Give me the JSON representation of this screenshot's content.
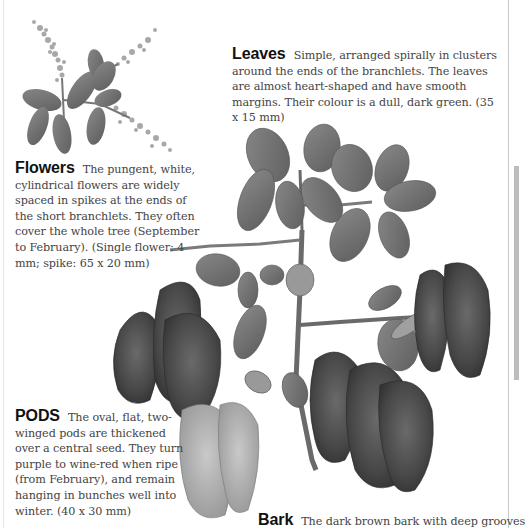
{
  "sections": {
    "leaves": {
      "heading": "Leaves",
      "text": "Simple, arranged spirally in clusters around the ends of the branchlets. The leaves are almost heart-shaped and have smooth margins. Their colour is a dull, dark green.  (35 x 15 mm)"
    },
    "flowers": {
      "heading": "Flowers",
      "text": "The pungent, white, cylindrical flowers are widely spaced in spikes at the ends of the short branchlets. They often cover the whole tree (September to February). (Single flower: 4 mm; spike: 65 x 20 mm)"
    },
    "pods": {
      "heading": "PODS",
      "text": "The oval, flat, two-winged pods are thickened over a central seed. They turn purple to wine-red when ripe (from February), and remain hanging in bunches well into winter.  (40 x 30 mm)"
    },
    "bark": {
      "heading": "Bark",
      "text": "The dark brown bark with deep grooves"
    }
  },
  "illustrations": {
    "flower_sprig": "flower-spike-illustration",
    "main_branch": "branch-with-leaves-and-pods-illustration"
  },
  "colors": {
    "heading": "#111111",
    "body_text": "#444444",
    "leaf": "#6e6e6e",
    "pod_dark": "#4a4a4a",
    "pod_light": "#a8a8a8",
    "page_tab": "#bdbdbd"
  }
}
